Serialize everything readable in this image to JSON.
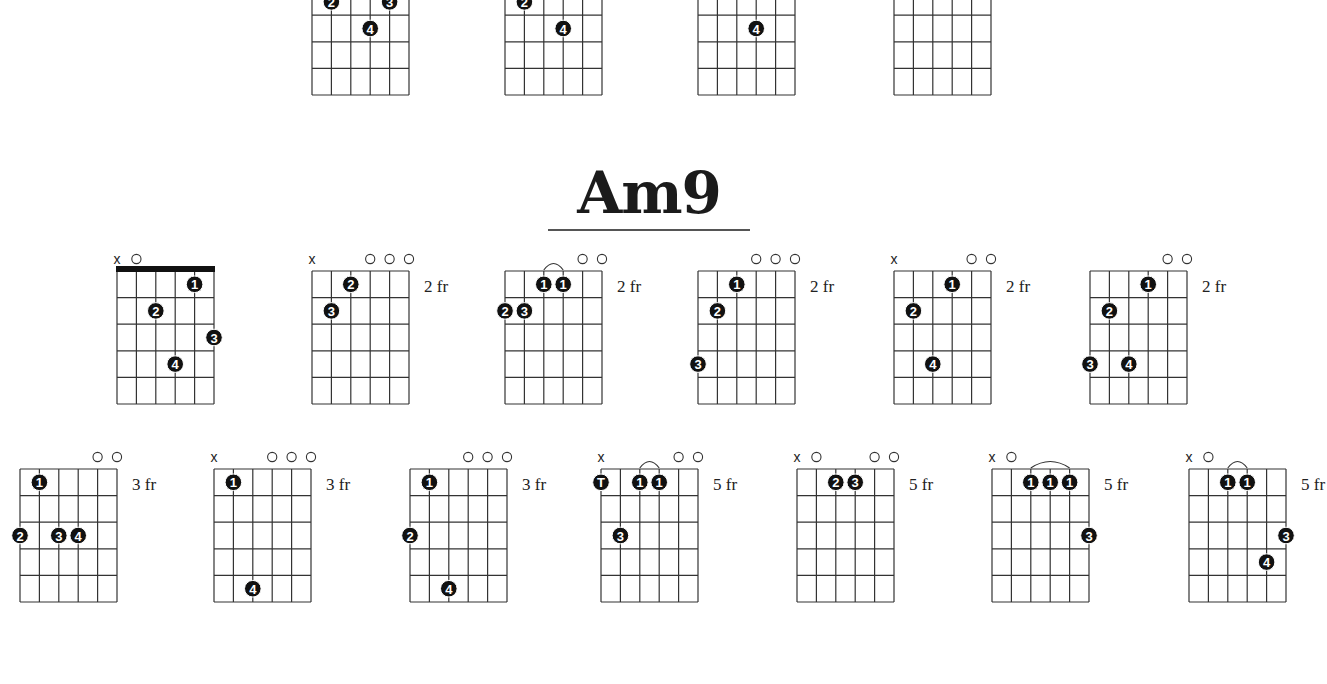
{
  "page": {
    "title": "Am9",
    "fret_suffix": "fr"
  },
  "chart_data": {
    "type": "table",
    "title": "Am9",
    "partial_top_row": [
      {
        "id": "t1",
        "x": 312,
        "dots": [
          {
            "s": 1,
            "f": 2,
            "l": "2"
          },
          {
            "s": 4,
            "f": 2,
            "l": "3"
          },
          {
            "s": 3,
            "f": 3,
            "l": "4"
          }
        ]
      },
      {
        "id": "t2",
        "x": 505,
        "dots": [
          {
            "s": 1,
            "f": 2,
            "l": "2"
          },
          {
            "s": 3,
            "f": 3,
            "l": "4"
          }
        ]
      },
      {
        "id": "t3",
        "x": 698,
        "dots": [
          {
            "s": 3,
            "f": 3,
            "l": "4"
          }
        ]
      },
      {
        "id": "t4",
        "x": 894,
        "dots": [
          {
            "s": 1,
            "f": 1,
            "l": "2"
          }
        ]
      }
    ],
    "chords": [
      {
        "id": "c1",
        "row": 1,
        "x": 117,
        "top_markers": [
          "x",
          "o",
          "",
          "",
          "",
          ""
        ],
        "nut": true,
        "fret": "",
        "dots": [
          {
            "s": 4,
            "f": 1,
            "l": "1"
          },
          {
            "s": 2,
            "f": 2,
            "l": "2"
          },
          {
            "s": 5,
            "f": 3,
            "l": "3"
          },
          {
            "s": 3,
            "f": 4,
            "l": "4"
          }
        ],
        "barres": []
      },
      {
        "id": "c2",
        "row": 1,
        "x": 312,
        "top_markers": [
          "x",
          "",
          "",
          "o",
          "o",
          "o"
        ],
        "nut": false,
        "fret": "2",
        "dots": [
          {
            "s": 2,
            "f": 1,
            "l": "2"
          },
          {
            "s": 1,
            "f": 2,
            "l": "3"
          }
        ],
        "barres": []
      },
      {
        "id": "c3",
        "row": 1,
        "x": 505,
        "top_markers": [
          "",
          "",
          "",
          "",
          "o",
          "o"
        ],
        "nut": false,
        "fret": "2",
        "dots": [
          {
            "s": 2,
            "f": 1,
            "l": "1"
          },
          {
            "s": 3,
            "f": 1,
            "l": "1"
          },
          {
            "s": 0,
            "f": 2,
            "l": "2"
          },
          {
            "s": 1,
            "f": 2,
            "l": "3"
          }
        ],
        "barres": [
          [
            2,
            3
          ]
        ]
      },
      {
        "id": "c4",
        "row": 1,
        "x": 698,
        "top_markers": [
          "",
          "",
          "",
          "o",
          "o",
          "o"
        ],
        "nut": false,
        "fret": "2",
        "dots": [
          {
            "s": 2,
            "f": 1,
            "l": "1"
          },
          {
            "s": 1,
            "f": 2,
            "l": "2"
          },
          {
            "s": 0,
            "f": 4,
            "l": "3"
          }
        ],
        "barres": []
      },
      {
        "id": "c5",
        "row": 1,
        "x": 894,
        "top_markers": [
          "x",
          "",
          "",
          "",
          "o",
          "o"
        ],
        "nut": false,
        "fret": "2",
        "dots": [
          {
            "s": 3,
            "f": 1,
            "l": "1"
          },
          {
            "s": 1,
            "f": 2,
            "l": "2"
          },
          {
            "s": 2,
            "f": 4,
            "l": "4"
          }
        ],
        "barres": []
      },
      {
        "id": "c6",
        "row": 1,
        "x": 1090,
        "top_markers": [
          "",
          "",
          "",
          "",
          "o",
          "o"
        ],
        "nut": false,
        "fret": "2",
        "dots": [
          {
            "s": 3,
            "f": 1,
            "l": "1"
          },
          {
            "s": 1,
            "f": 2,
            "l": "2"
          },
          {
            "s": 0,
            "f": 4,
            "l": "3"
          },
          {
            "s": 2,
            "f": 4,
            "l": "4"
          }
        ],
        "barres": []
      },
      {
        "id": "c7",
        "row": 2,
        "x": 20,
        "top_markers": [
          "",
          "",
          "",
          "",
          "o",
          "o"
        ],
        "nut": false,
        "fret": "3",
        "dots": [
          {
            "s": 1,
            "f": 1,
            "l": "1"
          },
          {
            "s": 0,
            "f": 3,
            "l": "2"
          },
          {
            "s": 2,
            "f": 3,
            "l": "3"
          },
          {
            "s": 3,
            "f": 3,
            "l": "4"
          }
        ],
        "barres": []
      },
      {
        "id": "c8",
        "row": 2,
        "x": 214,
        "top_markers": [
          "x",
          "",
          "",
          "o",
          "o",
          "o"
        ],
        "nut": false,
        "fret": "3",
        "dots": [
          {
            "s": 1,
            "f": 1,
            "l": "1"
          },
          {
            "s": 2,
            "f": 5,
            "l": "4"
          }
        ],
        "barres": []
      },
      {
        "id": "c9",
        "row": 2,
        "x": 410,
        "top_markers": [
          "",
          "",
          "",
          "o",
          "o",
          "o"
        ],
        "nut": false,
        "fret": "3",
        "dots": [
          {
            "s": 1,
            "f": 1,
            "l": "1"
          },
          {
            "s": 0,
            "f": 3,
            "l": "2"
          },
          {
            "s": 2,
            "f": 5,
            "l": "4"
          }
        ],
        "barres": []
      },
      {
        "id": "c10",
        "row": 2,
        "x": 601,
        "top_markers": [
          "x",
          "",
          "",
          "",
          "o",
          "o"
        ],
        "nut": false,
        "fret": "5",
        "dots": [
          {
            "s": 0,
            "f": 1,
            "l": "T"
          },
          {
            "s": 2,
            "f": 1,
            "l": "1"
          },
          {
            "s": 3,
            "f": 1,
            "l": "1"
          },
          {
            "s": 1,
            "f": 3,
            "l": "3"
          }
        ],
        "barres": [
          [
            2,
            3
          ]
        ]
      },
      {
        "id": "c11",
        "row": 2,
        "x": 797,
        "top_markers": [
          "x",
          "o",
          "",
          "",
          "o",
          "o"
        ],
        "nut": false,
        "fret": "5",
        "dots": [
          {
            "s": 2,
            "f": 1,
            "l": "2"
          },
          {
            "s": 3,
            "f": 1,
            "l": "3"
          }
        ],
        "barres": []
      },
      {
        "id": "c12",
        "row": 2,
        "x": 992,
        "top_markers": [
          "x",
          "o",
          "",
          "",
          "",
          ""
        ],
        "nut": false,
        "fret": "5",
        "dots": [
          {
            "s": 2,
            "f": 1,
            "l": "1"
          },
          {
            "s": 3,
            "f": 1,
            "l": "1"
          },
          {
            "s": 4,
            "f": 1,
            "l": "1"
          },
          {
            "s": 5,
            "f": 3,
            "l": "3"
          }
        ],
        "barres": [
          [
            2,
            4
          ]
        ]
      },
      {
        "id": "c13",
        "row": 2,
        "x": 1189,
        "top_markers": [
          "x",
          "o",
          "",
          "",
          "",
          ""
        ],
        "nut": false,
        "fret": "5",
        "dots": [
          {
            "s": 2,
            "f": 1,
            "l": "1"
          },
          {
            "s": 3,
            "f": 1,
            "l": "1"
          },
          {
            "s": 5,
            "f": 3,
            "l": "3"
          },
          {
            "s": 4,
            "f": 4,
            "l": "4"
          }
        ],
        "barres": [
          [
            2,
            3
          ]
        ]
      }
    ]
  }
}
